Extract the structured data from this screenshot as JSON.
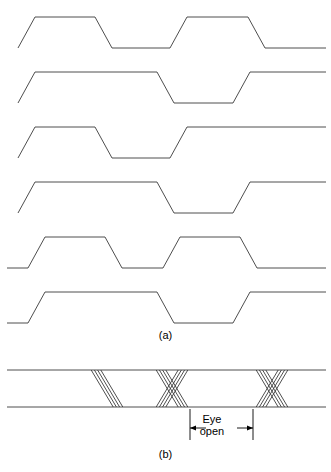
{
  "figure": {
    "panel_a_caption": "(a)",
    "panel_b_caption": "(b)",
    "eye_open_line1": "Eye",
    "eye_open_line2": "open",
    "stroke_color": "#3a3a3a",
    "background_color": "#ffffff"
  },
  "chart_data": {
    "type": "line",
    "title": "",
    "xlabel": "",
    "ylabel": "",
    "grid": false,
    "legend_position": "none",
    "panels": [
      {
        "id": "a",
        "caption": "(a)",
        "description": "Six overlaid binary NRZ waveforms with finite rise and fall times, drawn as trapezoidal pulse trains.",
        "x_range": [
          0,
          331
        ],
        "levels": {
          "high": 0,
          "low": 1
        },
        "traces": [
          {
            "name": "waveform-1",
            "y_high": 17,
            "y_low": 48,
            "points": [
              [
                18,
                1
              ],
              [
                35,
                0
              ],
              [
                95,
                0
              ],
              [
                112,
                1
              ],
              [
                170,
                1
              ],
              [
                187,
                0
              ],
              [
                248,
                0
              ],
              [
                265,
                1
              ],
              [
                326,
                1
              ]
            ]
          },
          {
            "name": "waveform-2",
            "y_high": 72,
            "y_low": 103,
            "points": [
              [
                18,
                1
              ],
              [
                35,
                0
              ],
              [
                157,
                0
              ],
              [
                174,
                1
              ],
              [
                233,
                1
              ],
              [
                250,
                0
              ],
              [
                326,
                0
              ]
            ]
          },
          {
            "name": "waveform-3",
            "y_high": 127,
            "y_low": 158,
            "points": [
              [
                18,
                1
              ],
              [
                35,
                0
              ],
              [
                95,
                0
              ],
              [
                112,
                1
              ],
              [
                170,
                1
              ],
              [
                187,
                0
              ],
              [
                326,
                0
              ]
            ]
          },
          {
            "name": "waveform-4",
            "y_high": 182,
            "y_low": 213,
            "points": [
              [
                18,
                1
              ],
              [
                35,
                0
              ],
              [
                157,
                0
              ],
              [
                174,
                1
              ],
              [
                233,
                1
              ],
              [
                250,
                0
              ],
              [
                326,
                0
              ]
            ]
          },
          {
            "name": "waveform-5",
            "y_high": 237,
            "y_low": 268,
            "points": [
              [
                7,
                1
              ],
              [
                28,
                1
              ],
              [
                45,
                0
              ],
              [
                105,
                0
              ],
              [
                122,
                1
              ],
              [
                163,
                1
              ],
              [
                180,
                0
              ],
              [
                240,
                0
              ],
              [
                257,
                1
              ],
              [
                326,
                1
              ]
            ]
          },
          {
            "name": "waveform-6",
            "y_high": 292,
            "y_low": 323,
            "points": [
              [
                7,
                1
              ],
              [
                28,
                1
              ],
              [
                45,
                0
              ],
              [
                157,
                0
              ],
              [
                174,
                1
              ],
              [
                233,
                1
              ],
              [
                250,
                0
              ],
              [
                326,
                0
              ]
            ]
          }
        ]
      },
      {
        "id": "b",
        "caption": "(b)",
        "description": "Eye diagram formed by superimposing the waveforms of panel (a); rails at top and bottom with three transition clusters.",
        "rail_top_y": 370,
        "rail_bottom_y": 407,
        "rail_x_start": 7,
        "rail_x_end": 326,
        "clusters": [
          {
            "name": "cluster-1",
            "type": "falling-parallel",
            "center_x": 107,
            "falling_count": 4,
            "rising_count": 0
          },
          {
            "name": "cluster-2",
            "type": "crossing",
            "center_x": 172,
            "falling_count": 4,
            "rising_count": 4
          },
          {
            "name": "cluster-3",
            "type": "crossing",
            "center_x": 272,
            "falling_count": 4,
            "rising_count": 4
          }
        ],
        "annotation": {
          "name": "eye-open",
          "text_line1": "Eye",
          "text_line2": "open",
          "left_x": 190,
          "right_x": 253,
          "arrow_y": 428,
          "tick_top_y": 409,
          "tick_bottom_y": 440
        }
      }
    ]
  }
}
